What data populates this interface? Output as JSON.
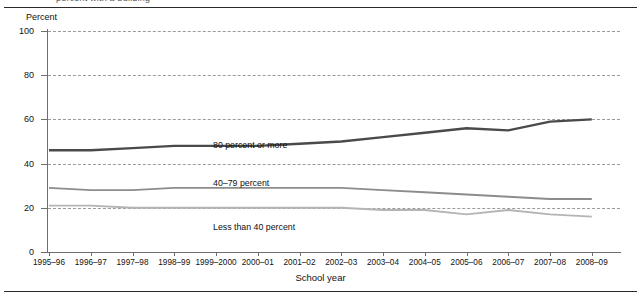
{
  "caption": "percent with a building",
  "axes": {
    "y_title": "Percent",
    "x_title": "School year",
    "y_ticks": [
      "0",
      "20",
      "40",
      "60",
      "80",
      "100"
    ]
  },
  "series_labels": {
    "top": "80 percent or more",
    "mid": "40–79 percent",
    "bottom": "Less than 40 percent"
  },
  "chart_data": {
    "type": "line",
    "title": "",
    "xlabel": "School year",
    "ylabel": "Percent",
    "ylim": [
      0,
      100
    ],
    "yticks": [
      0,
      20,
      40,
      60,
      80,
      100
    ],
    "grid": true,
    "legend": "inline-labels",
    "categories": [
      "1995–96",
      "1996–97",
      "1997–98",
      "1998–99",
      "1999–2000",
      "2000–01",
      "2001–02",
      "2002–03",
      "2003–04",
      "2004–05",
      "2005–06",
      "2006–07",
      "2007–08",
      "2008–09"
    ],
    "series": [
      {
        "name": "80 percent or more",
        "color": "#4a4a4a",
        "values": [
          46,
          46,
          47,
          48,
          48,
          48,
          49,
          50,
          52,
          54,
          56,
          55,
          59,
          60
        ]
      },
      {
        "name": "40–79 percent",
        "color": "#8c8c8c",
        "values": [
          29,
          28,
          28,
          29,
          29,
          29,
          29,
          29,
          28,
          27,
          26,
          25,
          24,
          24
        ]
      },
      {
        "name": "Less than 40 percent",
        "color": "#b4b4b4",
        "values": [
          21,
          21,
          20,
          20,
          20,
          20,
          20,
          20,
          19,
          19,
          17,
          19,
          17,
          16
        ]
      }
    ]
  }
}
